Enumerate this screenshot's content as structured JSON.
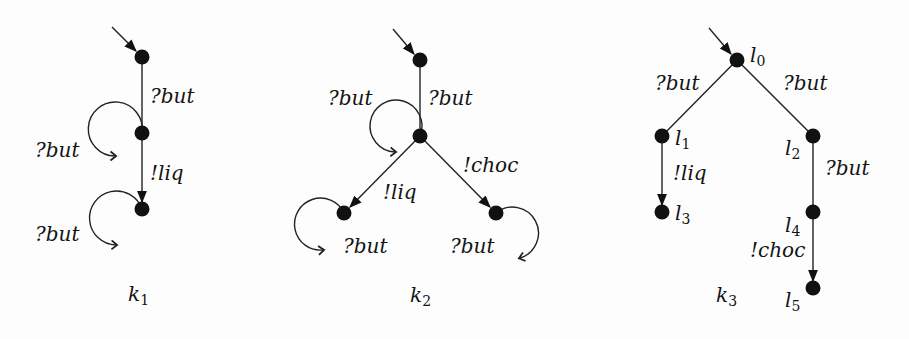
{
  "diagrams": [
    {
      "name": "k1",
      "caption": {
        "base": "k",
        "sub": "1"
      },
      "nodes": [
        {
          "id": "s0",
          "x": 142,
          "y": 57,
          "initial": true
        },
        {
          "id": "s1",
          "x": 142,
          "y": 133
        },
        {
          "id": "s2",
          "x": 142,
          "y": 209
        }
      ],
      "edges": [
        {
          "from": "s0",
          "to": "s1",
          "label": "?but",
          "arrow": false
        },
        {
          "from": "s1",
          "to": "s2",
          "label": "!liq",
          "arrow": true
        },
        {
          "from": "s1",
          "to": "s1",
          "label": "?but",
          "loop": "left"
        },
        {
          "from": "s2",
          "to": "s2",
          "label": "?but",
          "loop": "left"
        }
      ]
    },
    {
      "name": "k2",
      "caption": {
        "base": "k",
        "sub": "2"
      },
      "nodes": [
        {
          "id": "t0",
          "x": 420,
          "y": 60,
          "initial": true
        },
        {
          "id": "t1",
          "x": 420,
          "y": 136
        },
        {
          "id": "t2",
          "x": 344,
          "y": 213
        },
        {
          "id": "t3",
          "x": 496,
          "y": 213
        }
      ],
      "edges": [
        {
          "from": "t0",
          "to": "t1",
          "label": "?but",
          "arrow": false
        },
        {
          "from": "t1",
          "to": "t1",
          "label": "?but",
          "loop": "left"
        },
        {
          "from": "t1",
          "to": "t2",
          "label": "!liq",
          "arrow": true
        },
        {
          "from": "t1",
          "to": "t3",
          "label": "!choc",
          "arrow": true
        },
        {
          "from": "t2",
          "to": "t2",
          "label": "?but",
          "loop": "left"
        },
        {
          "from": "t3",
          "to": "t3",
          "label": "?but",
          "loop": "right"
        }
      ]
    },
    {
      "name": "k3",
      "caption": {
        "base": "k",
        "sub": "3"
      },
      "nodes": [
        {
          "id": "l0",
          "label": {
            "base": "l",
            "sub": "0"
          },
          "x": 737,
          "y": 60,
          "initial": true
        },
        {
          "id": "l1",
          "label": {
            "base": "l",
            "sub": "1"
          },
          "x": 662,
          "y": 136
        },
        {
          "id": "l2",
          "label": {
            "base": "l",
            "sub": "2"
          },
          "x": 813,
          "y": 136
        },
        {
          "id": "l3",
          "label": {
            "base": "l",
            "sub": "3"
          },
          "x": 662,
          "y": 212
        },
        {
          "id": "l4",
          "label": {
            "base": "l",
            "sub": "4"
          },
          "x": 813,
          "y": 212
        },
        {
          "id": "l5",
          "label": {
            "base": "l",
            "sub": "5"
          },
          "x": 813,
          "y": 288
        }
      ],
      "edges": [
        {
          "from": "l0",
          "to": "l1",
          "label": "?but",
          "arrow": false
        },
        {
          "from": "l0",
          "to": "l2",
          "label": "?but",
          "arrow": false
        },
        {
          "from": "l1",
          "to": "l3",
          "label": "!liq",
          "arrow": true
        },
        {
          "from": "l2",
          "to": "l4",
          "label": "?but",
          "arrow": false
        },
        {
          "from": "l4",
          "to": "l5",
          "label": "!choc",
          "arrow": true
        }
      ]
    }
  ],
  "labels": {
    "k1_e01": "?but",
    "k1_e12": "!liq",
    "k1_loop1": "?but",
    "k1_loop2": "?but",
    "k2_e01": "?but",
    "k2_loop1": "?but",
    "k2_e12": "!liq",
    "k2_e13": "!choc",
    "k2_loop2": "?but",
    "k2_loop3": "?but",
    "k3_e01": "?but",
    "k3_e02": "?but",
    "k3_e13": "!liq",
    "k3_e24": "?but",
    "k3_e45": "!choc",
    "cap_k": "k",
    "cap1": "1",
    "cap2": "2",
    "cap3": "3",
    "l": "l",
    "n0": "0",
    "n1": "1",
    "n2": "2",
    "n3": "3",
    "n4": "4",
    "n5": "5"
  }
}
